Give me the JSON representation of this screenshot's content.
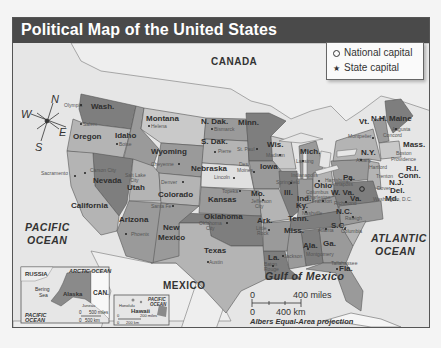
{
  "title": "Political Map of the United States",
  "legend": {
    "national_capital": "National capital",
    "state_capital": "State capital",
    "national_capital_symbol": "ring-icon",
    "state_capital_symbol": "star-icon"
  },
  "countries": {
    "canada": "CANADA",
    "mexico": "MEXICO",
    "russia": "RUSSIA",
    "can_abbr": "CAN."
  },
  "water": {
    "pacific_1": "PACIFIC",
    "pacific_2": "OCEAN",
    "atlantic_1": "ATLANTIC",
    "atlantic_2": "OCEAN",
    "gulf": "Gulf of Mexico",
    "arctic": "ARCTIC OCEAN",
    "bering_1": "Bering",
    "bering_2": "Sea",
    "inset_pacific_1": "PACIFIC",
    "inset_pacific_2": "OCEAN",
    "hawaii_pacific_1": "PACIFIC",
    "hawaii_pacific_2": "OCEAN"
  },
  "compass": {
    "n": "N",
    "s": "S",
    "e": "E",
    "w": "W"
  },
  "states": {
    "wash": "Wash.",
    "oregon": "Oregon",
    "idaho": "Idaho",
    "montana": "Montana",
    "wyoming": "Wyoming",
    "ndak": "N. Dak.",
    "sdak": "S. Dak.",
    "minn": "Minn.",
    "wis": "Wis.",
    "mich": "Mich.",
    "nevada": "Nevada",
    "california": "California",
    "utah": "Utah",
    "colorado": "Colorado",
    "nebraska": "Nebraska",
    "iowa": "Iowa",
    "ill": "Ill.",
    "ind": "Ind.",
    "ohio": "Ohio",
    "pa": "Pa.",
    "ny": "N.Y.",
    "vt": "Vt.",
    "nh": "N.H.",
    "maine": "Maine",
    "mass": "Mass.",
    "ri": "R.I.",
    "conn": "Conn.",
    "nj": "N.J.",
    "del": "Del.",
    "md": "Md.",
    "wva": "W. Va.",
    "va": "Va.",
    "ky": "Ky.",
    "tenn": "Tenn.",
    "nc": "N.C.",
    "sc": "S.C.",
    "ga": "Ga.",
    "ala": "Ala.",
    "miss": "Miss.",
    "la": "La.",
    "ark": "Ark.",
    "mo": "Mo.",
    "kansas": "Kansas",
    "oklahoma": "Oklahoma",
    "texas": "Texas",
    "new1": "New",
    "mexico_st": "Mexico",
    "arizona": "Arizona",
    "fla": "Fla.",
    "alaska": "Alaska",
    "hawaii": "Hawaii"
  },
  "capitals": {
    "olympia": "Olympia",
    "salem": "Salem",
    "boise": "Boise",
    "helena": "Helena",
    "bismarck": "Bismarck",
    "pierre": "Pierre",
    "stpaul": "St. Paul",
    "madison": "Madison",
    "lansing": "Lansing",
    "cheyenne": "Cheyenne",
    "lincoln": "Lincoln",
    "desmoines_1": "Des",
    "desmoines_2": "Moines",
    "springfield": "Springfield",
    "indianapolis": "Indianapolis",
    "columbus": "Columbus",
    "harrisburg": "Harrisburg",
    "albany": "Albany",
    "montpelier": "Montpelier",
    "concord": "Concord",
    "augusta": "Augusta",
    "boston": "Boston",
    "providence": "Providence",
    "hartford": "Hartford",
    "trenton": "Trenton",
    "dover": "Dover",
    "annapolis": "Annapolis",
    "charleston": "Charleston",
    "richmond": "Richmond",
    "washington_dc": "Washington, D.C.",
    "frankfort": "Frankfort",
    "nashville": "Nashville",
    "raleigh": "Raleigh",
    "columbia": "Columbia",
    "atlanta": "Atlanta",
    "montgomery": "Montgomery",
    "jackson": "Jackson",
    "batonrouge_1": "Baton",
    "batonrouge_2": "Rouge",
    "littlerock_1": "Little",
    "littlerock_2": "Rock",
    "jeffersoncity_1": "Jefferson",
    "jeffersoncity_2": "City",
    "topeka": "Topeka",
    "okcity_1": "Oklahoma",
    "okcity_2": "City",
    "austin": "Austin",
    "santafe": "Santa Fe",
    "denver": "Denver",
    "saltlake_1": "Salt Lake",
    "saltlake_2": "City",
    "carsoncity": "Carson City",
    "sacramento": "Sacramento",
    "phoenix": "Phoenix",
    "tallahassee": "Tallahassee",
    "juneau": "Juneau",
    "honolulu": "Honolulu"
  },
  "scale": {
    "zero_top": "0",
    "miles": "400 miles",
    "zero_bottom": "0",
    "km": "400 km",
    "projection": "Albers Equal-Area projection"
  },
  "alaska_scale": {
    "zero_top": "0",
    "miles": "500 miles",
    "zero_bottom": "0",
    "km": "500 km"
  },
  "hawaii_scale": {
    "zero_top": "0",
    "miles": "200 miles",
    "zero_bottom": "0",
    "km": "200 km"
  },
  "colors": {
    "title_bar": "#4a4a4a",
    "water": "#e6e6e6",
    "land_foreign": "#eeeeee",
    "state_light": "#b4b4b4",
    "state_mid": "#9a9a9a",
    "state_dark": "#7e7e7e",
    "state_pale": "#c9c9c9"
  }
}
